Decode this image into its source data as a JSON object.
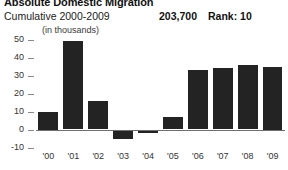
{
  "header": {
    "title": "Absolute Domestic Migration",
    "subtitle": "Cumulative 2000-2009",
    "value": "203,700",
    "rank": "Rank: 10",
    "units_note": "(in thousands)"
  },
  "colors": {
    "bar": "#232323",
    "axis": "#6f6f6f",
    "tick": "#8a8a8a",
    "text": "#1a1a1a",
    "background": "#ffffff"
  },
  "chart_data": {
    "type": "bar",
    "title": "Absolute Domestic Migration",
    "subtitle": "Cumulative 2000-2009",
    "xlabel": "",
    "ylabel": "(in thousands)",
    "categories": [
      "'00",
      "'01",
      "'02",
      "'03",
      "'04",
      "'05",
      "'06",
      "'07",
      "'08",
      "'09"
    ],
    "values": [
      10,
      49,
      16,
      -5,
      -2,
      7,
      33,
      34,
      36,
      35
    ],
    "ylim": [
      -10,
      50
    ],
    "yticks": [
      50,
      40,
      30,
      20,
      10,
      0,
      -10
    ],
    "ytick_labels": [
      "50",
      "40",
      "30",
      "20",
      "10",
      "0",
      "-10"
    ],
    "grid": false,
    "legend": "none",
    "cumulative_total": "203,700",
    "rank": 10
  }
}
